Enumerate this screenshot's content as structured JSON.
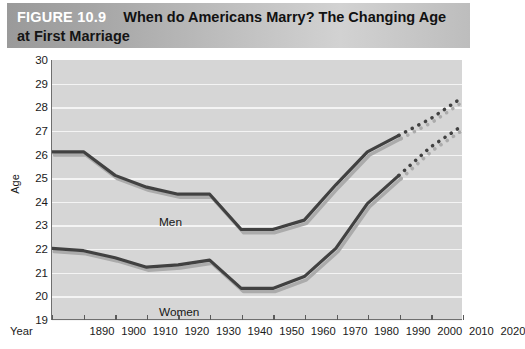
{
  "figure": {
    "number_label": "FIGURE 10.9",
    "title_line1": "When do Americans Marry? The Changing Age",
    "title_line2": "at First Marriage"
  },
  "axes": {
    "y_title": "Age",
    "x_title": "Year",
    "y_ticks": [
      "30",
      "29",
      "28",
      "27",
      "26",
      "25",
      "24",
      "23",
      "22",
      "21",
      "20",
      "19"
    ],
    "x_ticks": [
      "1890",
      "1900",
      "1910",
      "1920",
      "1930",
      "1940",
      "1950",
      "1960",
      "1970",
      "1980",
      "1990",
      "2000",
      "2010",
      "2020"
    ]
  },
  "series_labels": {
    "men": "Men",
    "women": "Women"
  },
  "colors": {
    "line": "#414141",
    "shadow": "#ababab",
    "plot_background": "#d6d6d6",
    "gridline": "#f4f4f4",
    "axis": "#6f6f6f",
    "banner_left": "#9a9a9a",
    "banner_right": "#bdbdbd",
    "figure_number_text": "#ffffff",
    "title_text": "#111111"
  },
  "chart_data": {
    "type": "line",
    "title": "When do Americans Marry? The Changing Age at First Marriage",
    "xlabel": "Year",
    "ylabel": "Age",
    "ylim": [
      19,
      30
    ],
    "xlim": [
      1890,
      2020
    ],
    "grid": true,
    "legend": "inline labels on lines",
    "x": [
      1890,
      1900,
      1910,
      1920,
      1930,
      1940,
      1950,
      1960,
      1970,
      1980,
      1990,
      2000,
      2010,
      2020
    ],
    "series": [
      {
        "name": "Men",
        "values": [
          26.1,
          26.1,
          25.1,
          24.6,
          24.3,
          24.3,
          22.8,
          22.8,
          23.2,
          24.7,
          26.1,
          26.8,
          27.5,
          28.4
        ],
        "solid_through": 2000,
        "projected_from": 2000,
        "style": "solid then dotted projection"
      },
      {
        "name": "Women",
        "values": [
          22.0,
          21.9,
          21.6,
          21.2,
          21.3,
          21.5,
          20.3,
          20.3,
          20.8,
          22.0,
          23.9,
          25.1,
          26.3,
          27.2
        ],
        "solid_through": 2000,
        "projected_from": 2000,
        "style": "solid then dotted projection"
      }
    ]
  }
}
